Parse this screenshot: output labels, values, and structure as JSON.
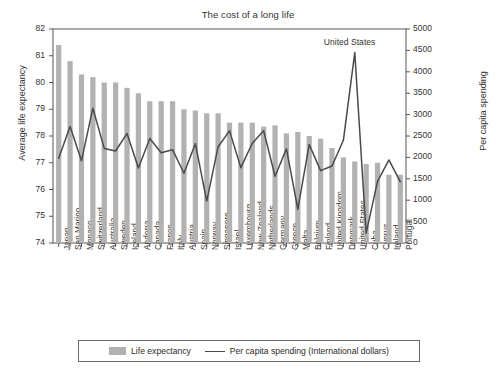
{
  "chart_data": {
    "type": "bar",
    "title": "The cost of a long life",
    "xlabel": "",
    "ylabel": "Average life expectancy",
    "y2label": "Per capita spending",
    "ylim": [
      74,
      82
    ],
    "y2lim": [
      0,
      5000
    ],
    "yticks": [
      74,
      75,
      76,
      77,
      78,
      79,
      80,
      81,
      82
    ],
    "y2ticks": [
      0,
      500,
      1000,
      1500,
      2000,
      2500,
      3000,
      3500,
      4000,
      4500,
      5000
    ],
    "grid": false,
    "legend_position": "bottom",
    "categories": [
      "Japan",
      "San Marino",
      "Monaco",
      "Switzerland",
      "Australia",
      "Sweden",
      "Iceland",
      "Andorra",
      "Canada",
      "France",
      "Italy",
      "Austria",
      "Spain",
      "Norway",
      "Singapore",
      "Israel",
      "Luxembourg",
      "New Zealand",
      "Netherlands",
      "Germany",
      "Greece",
      "Malta",
      "Belgium",
      "Finland",
      "United Kingdom",
      "Denmark",
      "United States",
      "Cuba",
      "Cyprus",
      "Ireland",
      "Portugal"
    ],
    "series": [
      {
        "name": "Life expectancy",
        "type": "bar",
        "axis": "left",
        "color": "#b2b2b2",
        "values": [
          81.4,
          80.8,
          80.3,
          80.2,
          80.0,
          80.0,
          79.8,
          79.6,
          79.3,
          79.3,
          79.3,
          79.0,
          78.95,
          78.85,
          78.85,
          78.5,
          78.5,
          78.5,
          78.35,
          78.4,
          78.1,
          78.15,
          78.0,
          77.9,
          77.55,
          77.2,
          77.05,
          76.95,
          77.0,
          76.55,
          76.55
        ]
      },
      {
        "name": "Per capita spending (International dollars)",
        "type": "line",
        "axis": "right",
        "color": "#4a4a4a",
        "values": [
          1980,
          2720,
          1920,
          3150,
          2210,
          2150,
          2560,
          1750,
          2440,
          2110,
          2180,
          1630,
          2320,
          980,
          2250,
          2620,
          1760,
          2330,
          2620,
          1560,
          2200,
          790,
          2300,
          1690,
          1800,
          2400,
          4450,
          230,
          1440,
          1940,
          1430
        ]
      }
    ],
    "annotations": [
      {
        "text": "United States",
        "x": "United States",
        "y": 5000
      }
    ]
  },
  "legend": {
    "items": [
      {
        "label": "Life expectancy",
        "marker": "bar-swatch"
      },
      {
        "label": "Per capita spending (International dollars)",
        "marker": "line-swatch"
      }
    ]
  }
}
